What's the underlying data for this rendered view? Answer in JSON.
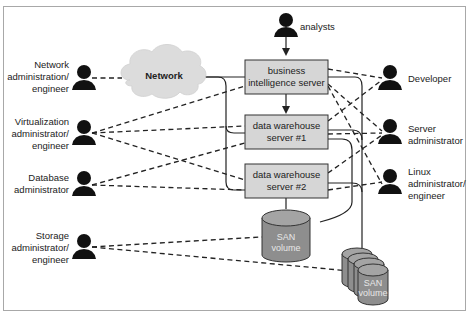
{
  "diagram": {
    "title": "",
    "cloud": {
      "label": "Network"
    },
    "servers": [
      {
        "id": "bi",
        "lines": [
          "business",
          "intelligence server"
        ]
      },
      {
        "id": "dw1",
        "lines": [
          "data warehouse",
          "server #1"
        ]
      },
      {
        "id": "dw2",
        "lines": [
          "data warehouse",
          "server #2"
        ]
      }
    ],
    "storage": [
      {
        "id": "san1",
        "lines": [
          "SAN",
          "volume"
        ]
      },
      {
        "id": "san2",
        "lines": [
          "SAN",
          "volume"
        ]
      }
    ],
    "people_left": [
      {
        "id": "network-admin",
        "lines": [
          "Network",
          "administration/",
          "engineer"
        ]
      },
      {
        "id": "virtualization-admin",
        "lines": [
          "Virtualization",
          "administrator/",
          "engineer"
        ]
      },
      {
        "id": "database-admin",
        "lines": [
          "Database",
          "administrator"
        ]
      },
      {
        "id": "storage-admin",
        "lines": [
          "Storage",
          "administrator/",
          "engineer"
        ]
      }
    ],
    "people_top": [
      {
        "id": "analysts",
        "lines": [
          "analysts"
        ]
      }
    ],
    "people_right": [
      {
        "id": "developer",
        "lines": [
          "Developer"
        ]
      },
      {
        "id": "server-admin",
        "lines": [
          "Server",
          "administrator"
        ]
      },
      {
        "id": "linux-admin",
        "lines": [
          "Linux",
          "administrator/",
          "engineer"
        ]
      }
    ],
    "colors": {
      "box_fill": "#d6d6d6",
      "cloud_fill": "#dcdcdc",
      "san_fill": "#8e8e8e",
      "san_top": "#a4a4a4",
      "line": "#222222",
      "person": "#111111"
    }
  }
}
